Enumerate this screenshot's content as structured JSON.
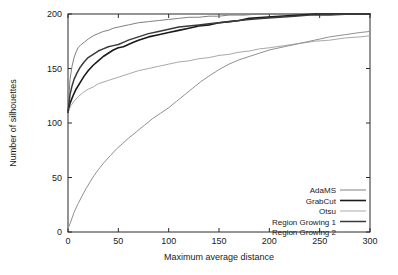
{
  "chart_data": {
    "type": "line",
    "title": "",
    "xlabel": "Maximum average distance",
    "ylabel": "Number of silhouettes",
    "xlim": [
      0,
      300
    ],
    "ylim": [
      0,
      200
    ],
    "xticks": [
      0,
      50,
      100,
      150,
      200,
      250,
      300
    ],
    "yticks": [
      0,
      50,
      100,
      150,
      200
    ],
    "grid": false,
    "legend_position": "lower right",
    "series": [
      {
        "name": "AdaMS",
        "color": "#808080",
        "width": 1.0,
        "x": [
          0,
          2,
          4,
          6,
          8,
          10,
          13,
          16,
          20,
          25,
          30,
          35,
          40,
          45,
          50,
          60,
          70,
          80,
          90,
          100,
          110,
          120,
          130,
          140,
          150,
          160,
          175,
          190,
          210,
          230,
          250,
          270,
          300
        ],
        "y": [
          110,
          140,
          152,
          160,
          165,
          169,
          172,
          174,
          177,
          180,
          182,
          184,
          185,
          187,
          188,
          190,
          192,
          193,
          194,
          195,
          196,
          197,
          197,
          198,
          198,
          199,
          199,
          200,
          200,
          200,
          200,
          200,
          200
        ]
      },
      {
        "name": "GrabCut",
        "color": "#1a1a1a",
        "width": 1.6,
        "x": [
          0,
          2,
          5,
          8,
          12,
          16,
          20,
          25,
          30,
          35,
          40,
          45,
          50,
          55,
          60,
          65,
          70,
          80,
          90,
          100,
          110,
          120,
          130,
          140,
          150,
          160,
          170,
          180,
          195,
          210,
          230,
          245,
          260,
          280,
          300
        ],
        "y": [
          110,
          118,
          125,
          131,
          137,
          143,
          148,
          153,
          157,
          161,
          164,
          167,
          169,
          170,
          172,
          174,
          176,
          179,
          181,
          183,
          185,
          187,
          189,
          190,
          192,
          193,
          194,
          196,
          197,
          198,
          199,
          200,
          200,
          200,
          200
        ]
      },
      {
        "name": "Otsu",
        "color": "#a9a9a9",
        "width": 1.0,
        "x": [
          0,
          3,
          6,
          10,
          15,
          20,
          25,
          30,
          40,
          50,
          60,
          70,
          80,
          90,
          100,
          110,
          120,
          130,
          140,
          150,
          160,
          170,
          180,
          190,
          200,
          215,
          230,
          245,
          260,
          275,
          290,
          300
        ],
        "y": [
          110,
          116,
          120,
          124,
          128,
          131,
          133,
          136,
          139,
          142,
          145,
          148,
          150,
          152,
          154,
          156,
          157,
          159,
          160,
          162,
          163,
          165,
          166,
          168,
          169,
          171,
          173,
          175,
          176,
          178,
          179,
          180
        ]
      },
      {
        "name": "Region Growing 1",
        "color": "#3a3a3a",
        "width": 1.5,
        "x": [
          0,
          2,
          4,
          6,
          9,
          12,
          16,
          20,
          25,
          30,
          35,
          40,
          45,
          50,
          55,
          60,
          70,
          80,
          90,
          100,
          110,
          120,
          130,
          140,
          150,
          160,
          170,
          180,
          195,
          210,
          225,
          240,
          260,
          280,
          300
        ],
        "y": [
          110,
          126,
          134,
          140,
          146,
          151,
          156,
          160,
          163,
          166,
          168,
          170,
          171,
          172,
          174,
          176,
          179,
          182,
          184,
          186,
          188,
          189,
          190,
          191,
          192,
          193,
          194,
          195,
          196,
          197,
          198,
          199,
          199,
          200,
          200
        ]
      },
      {
        "name": "Region Growing 2",
        "color": "#909090",
        "width": 1.0,
        "x": [
          0,
          3,
          6,
          10,
          14,
          18,
          22,
          26,
          30,
          36,
          42,
          48,
          54,
          60,
          68,
          76,
          84,
          92,
          100,
          108,
          116,
          124,
          132,
          140,
          150,
          160,
          170,
          180,
          190,
          200,
          215,
          230,
          245,
          260,
          275,
          290,
          300
        ],
        "y": [
          3,
          10,
          18,
          26,
          33,
          40,
          46,
          52,
          57,
          64,
          70,
          76,
          81,
          86,
          92,
          98,
          104,
          109,
          114,
          120,
          126,
          132,
          138,
          143,
          149,
          154,
          158,
          161,
          164,
          167,
          170,
          173,
          176,
          179,
          181,
          183,
          184
        ]
      }
    ],
    "legend_entries": [
      {
        "label": "AdaMS"
      },
      {
        "label": "GrabCut"
      },
      {
        "label": "Otsu"
      },
      {
        "label": "Region Growing 1"
      },
      {
        "label": "Region Growing 2"
      }
    ]
  }
}
